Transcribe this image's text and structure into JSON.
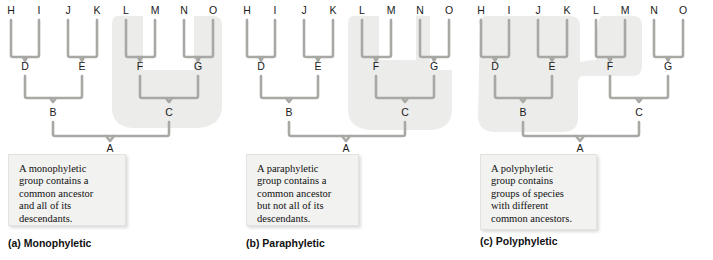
{
  "figure": {
    "colors": {
      "branch": "#a8a8a4",
      "branch_shadow": "#c9c9c5",
      "highlight": "#ececea",
      "label_text": "#1a1a1a",
      "box_fill": "#f2f2f0",
      "box_border": "#e2e2de",
      "background": "#ffffff"
    },
    "tip_labels": [
      "H",
      "I",
      "J",
      "K",
      "L",
      "M",
      "N",
      "O"
    ],
    "node_labels": [
      "A",
      "B",
      "C",
      "D",
      "E",
      "F",
      "G"
    ],
    "tip_x": [
      11,
      39,
      68,
      97,
      126,
      155,
      184,
      213
    ],
    "geometry": {
      "tip_label_y": 14,
      "tip_top_y": 20,
      "clade_bottom_y": 57,
      "level1_label_y": 70,
      "level1_stem_top_y": 76,
      "level2_bottom_y": 98,
      "level2_label_y": 116,
      "level2_stem_top_y": 122,
      "root_bar_y": 136,
      "root_label_y": 152,
      "root_stem_top_y": 158,
      "root_stem_bottom_y": 215
    }
  },
  "panels": [
    {
      "id": "a",
      "caption": "(a) Monophyletic",
      "infobox_text": "A monophyletic\ngroup contains a\ncommon ancestor\nand all of its\ndescendants.",
      "group_type": "monophyletic",
      "highlighted_tips": [
        "L",
        "M",
        "N",
        "O"
      ],
      "highlighted_nodes": [
        "F",
        "G",
        "C"
      ],
      "highlight_shape": "rounded-blob-right",
      "highlight_path": "M 117 16 Q 112 16 112 26 L 112 108 Q 112 126 132 128 L 198 128 Q 222 126 222 106 L 222 26 Q 222 16 214 16 L 194 16 L 194 70 L 143 70 L 143 16 Z"
    },
    {
      "id": "b",
      "caption": "(b) Paraphyletic",
      "infobox_text": "A paraphyletic\ngroup contains a\ncommon ancestor\nbut not all of its\ndescendants.",
      "group_type": "paraphyletic",
      "highlighted_tips": [
        "L",
        "M",
        "N"
      ],
      "excluded_tips": [
        "O"
      ],
      "highlighted_nodes": [
        "F",
        "G",
        "C"
      ],
      "highlight_shape": "rounded-blob-right-notched",
      "highlight_path": "M 117 16 Q 112 16 112 26 L 112 110 Q 112 128 134 130 L 196 130 Q 216 128 216 110 L 216 70 L 194 70 L 194 16 L 180 16 L 180 60 L 143 60 L 143 16 Z"
    },
    {
      "id": "c",
      "caption": "(c) Polyphyletic",
      "infobox_text": "A polyphyletic\ngroup contains\ngroups of species\nwith different\ncommon ancestors.",
      "group_type": "polyphyletic",
      "highlighted_tips": [
        "H",
        "I",
        "J",
        "K",
        "L",
        "M"
      ],
      "excluded_tips": [
        "N",
        "O"
      ],
      "highlighted_nodes": [
        "D",
        "E",
        "B",
        "F"
      ],
      "excluded_nodes": [
        "G",
        "C"
      ],
      "highlight_shape": "two-blobs-joined",
      "highlight_path": "M 10 26 Q 6 16 18 16 L 100 16 Q 110 16 110 26 L 110 62 Q 118 60 126 60 Q 126 16 132 16 L 164 16 Q 172 16 172 26 L 172 66 Q 172 76 162 76 L 112 76 Q 108 76 108 86 L 108 118 Q 108 132 92 132 L 26 132 Q 8 132 8 116 Z"
    }
  ],
  "tree_structure": {
    "root": "A",
    "edges": [
      {
        "parent": "A",
        "children": [
          "B",
          "C"
        ]
      },
      {
        "parent": "B",
        "children": [
          "D",
          "E"
        ]
      },
      {
        "parent": "C",
        "children": [
          "F",
          "G"
        ]
      },
      {
        "parent": "D",
        "children": [
          "H",
          "I"
        ]
      },
      {
        "parent": "E",
        "children": [
          "J",
          "K"
        ]
      },
      {
        "parent": "F",
        "children": [
          "L",
          "M"
        ]
      },
      {
        "parent": "G",
        "children": [
          "N",
          "O"
        ]
      }
    ]
  }
}
